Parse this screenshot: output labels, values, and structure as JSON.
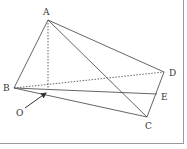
{
  "figure": {
    "type": "geometry-pyramid",
    "points": {
      "A": {
        "label": "A",
        "x": 48,
        "y": 20,
        "label_x": 43,
        "label_y": 15
      },
      "B": {
        "label": "B",
        "x": 14,
        "y": 88,
        "label_x": 3,
        "label_y": 91
      },
      "C": {
        "label": "C",
        "x": 147,
        "y": 117,
        "label_x": 145,
        "label_y": 129
      },
      "D": {
        "label": "D",
        "x": 164,
        "y": 72,
        "label_x": 169,
        "label_y": 76
      },
      "E": {
        "label": "E",
        "x": 157,
        "y": 94,
        "label_x": 161,
        "label_y": 100
      },
      "O": {
        "label": "O",
        "x": 48,
        "y": 89,
        "label_x": 16,
        "label_y": 116
      }
    },
    "segments": [
      {
        "from": "A",
        "to": "B",
        "style": "solid"
      },
      {
        "from": "A",
        "to": "C",
        "style": "solid"
      },
      {
        "from": "A",
        "to": "D",
        "style": "solid"
      },
      {
        "from": "B",
        "to": "C",
        "style": "solid"
      },
      {
        "from": "B",
        "to": "E",
        "style": "solid"
      },
      {
        "from": "C",
        "to": "D",
        "style": "solid"
      },
      {
        "from": "B",
        "to": "D",
        "style": "dashed"
      },
      {
        "from": "A",
        "to": "O",
        "style": "dashed"
      }
    ],
    "arrow": {
      "from_x": 25,
      "from_y": 108,
      "to_x": 46,
      "to_y": 93,
      "points_to": "O"
    },
    "colors": {
      "line": "#555555",
      "label": "#333333",
      "border": "#9a9a9a"
    }
  }
}
